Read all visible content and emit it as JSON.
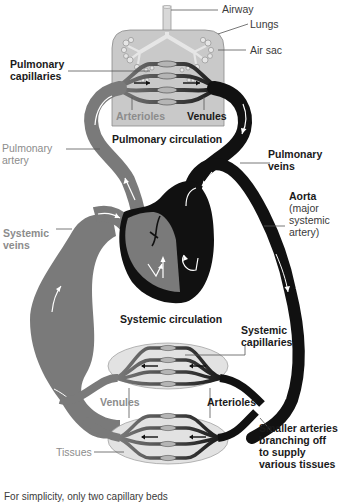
{
  "labels": {
    "airway": "Airway",
    "lungs": "Lungs",
    "air_sac": "Air sac",
    "pulmonary_capillaries": "Pulmonary\ncapillaries",
    "arterioles_top": "Arterioles",
    "venules_top": "Venules",
    "pulmonary_circulation": "Pulmonary circulation",
    "pulmonary_artery": "Pulmonary\nartery",
    "pulmonary_veins": "Pulmonary\nveins",
    "aorta": "Aorta",
    "aorta_note": "(major\nsystemic\nartery)",
    "systemic_veins": "Systemic\nveins",
    "systemic_circulation": "Systemic circulation",
    "systemic_capillaries": "Systemic\ncapillaries",
    "venules_bottom": "Venules",
    "arterioles_bottom": "Arterioles",
    "tissues": "Tissues",
    "smaller_arteries": "Smaller arteries\nbranching off\nto supply\nvarious tissues",
    "caption": "For simplicity, only two capillary beds"
  },
  "colors": {
    "deoxygenated": "#7a7a7a",
    "oxygenated": "#111111",
    "lung_fill": "#c9c9c9",
    "tissue_fill": "#e2e2e2",
    "label_grey": "#8c8c8c",
    "label_dark": "#1a1a1a"
  }
}
